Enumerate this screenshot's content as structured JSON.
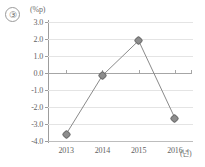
{
  "item_number": "③",
  "axis": {
    "y_unit": "(%p)",
    "x_unit": "(년)"
  },
  "chart_data": {
    "type": "line",
    "title": "",
    "xlabel": "(년)",
    "ylabel": "(%p)",
    "categories": [
      "2013",
      "2014",
      "2015",
      "2016"
    ],
    "values": [
      -3.6,
      -0.15,
      1.9,
      -2.65
    ],
    "series": [
      {
        "name": "",
        "values": [
          -3.6,
          -0.15,
          1.9,
          -2.65
        ]
      }
    ],
    "ylim": [
      -4.0,
      3.0
    ],
    "yticks": [
      "3.0",
      "2.0",
      "1.0",
      "0.0",
      "-1.0",
      "-2.0",
      "-3.0",
      "-4.0"
    ],
    "ytick_values": [
      3.0,
      2.0,
      1.0,
      0.0,
      -1.0,
      -2.0,
      -3.0,
      -4.0
    ],
    "grid": true,
    "legend": "none",
    "marker": "diamond",
    "line_color": "#8a8a8a",
    "marker_color": "#8d8d8d",
    "grid_color": "#e4e4e4",
    "zero_line_color": "#a6a6a6"
  }
}
